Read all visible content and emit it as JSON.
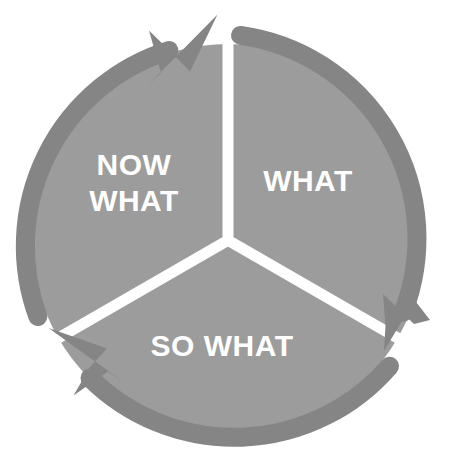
{
  "diagram": {
    "type": "three-segment-circular-cycle",
    "direction": "clockwise",
    "background_color": "#ffffff",
    "segment_fill_color": "#9c9c9c",
    "ring_color": "#858585",
    "divider_color": "#ffffff",
    "label_color": "#ffffff",
    "segments": [
      {
        "id": "what",
        "label": "WHAT",
        "label_lines": [
          "WHAT"
        ],
        "position": "right",
        "start_angle_deg": 0,
        "end_angle_deg": 120
      },
      {
        "id": "so-what",
        "label": "SO WHAT",
        "label_lines": [
          "SO WHAT"
        ],
        "position": "bottom",
        "start_angle_deg": 120,
        "end_angle_deg": 240
      },
      {
        "id": "now-what",
        "label": "NOW WHAT",
        "label_lines": [
          "NOW",
          "WHAT"
        ],
        "position": "left",
        "start_angle_deg": 240,
        "end_angle_deg": 360
      }
    ],
    "arrows": [
      {
        "id": "arrow-top",
        "points_to": "what",
        "position": "top",
        "heading": "clockwise-right"
      },
      {
        "id": "arrow-right",
        "points_to": "so-what",
        "position": "bottom-right",
        "heading": "clockwise-down"
      },
      {
        "id": "arrow-left",
        "points_to": "now-what",
        "position": "bottom-left",
        "heading": "clockwise-up-left"
      }
    ]
  }
}
